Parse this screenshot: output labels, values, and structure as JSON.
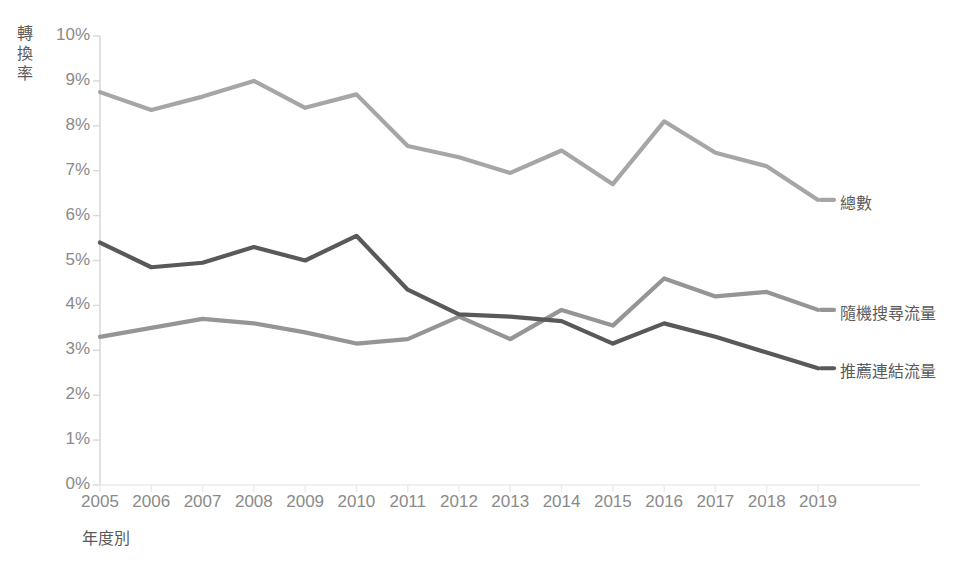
{
  "chart_data": {
    "type": "line",
    "title": "",
    "xlabel": "年度別",
    "ylabel": "轉換率",
    "grid": false,
    "legend_position": "right-inline",
    "xlim": [
      2005,
      2019
    ],
    "ylim": [
      0,
      0.1
    ],
    "ytick_labels": [
      "10%",
      "9%",
      "8%",
      "7%",
      "6%",
      "5%",
      "4%",
      "3%",
      "2%",
      "1%",
      "0%"
    ],
    "ytick_values": [
      10,
      9,
      8,
      7,
      6,
      5,
      4,
      3,
      2,
      1,
      0
    ],
    "categories": [
      "2005",
      "2006",
      "2007",
      "2008",
      "2009",
      "2010",
      "2011",
      "2012",
      "2013",
      "2014",
      "2015",
      "2016",
      "2017",
      "2018",
      "2019"
    ],
    "series": [
      {
        "name": "總數",
        "color": "#a6a6a6",
        "values": [
          8.75,
          8.35,
          8.65,
          9.0,
          8.4,
          8.7,
          7.55,
          7.3,
          6.95,
          7.45,
          6.7,
          8.1,
          7.4,
          7.1,
          6.35
        ]
      },
      {
        "name": "隨機搜尋流量",
        "color": "#959595",
        "values": [
          3.3,
          3.5,
          3.7,
          3.6,
          3.4,
          3.15,
          3.25,
          3.75,
          3.25,
          3.9,
          3.55,
          4.6,
          4.2,
          4.3,
          3.9
        ]
      },
      {
        "name": "推薦連結流量",
        "color": "#595959",
        "values": [
          5.4,
          4.85,
          4.95,
          5.3,
          5.0,
          5.55,
          4.35,
          3.8,
          3.75,
          3.65,
          3.15,
          3.6,
          3.3,
          2.95,
          2.6
        ]
      }
    ]
  },
  "axis": {
    "y_title": "轉換率",
    "x_title": "年度別"
  },
  "colors": {
    "total": "#a6a6a6",
    "organic": "#959595",
    "referral": "#595959",
    "axis": "#d9d9d9",
    "tick_text": "#8a8a8a"
  }
}
